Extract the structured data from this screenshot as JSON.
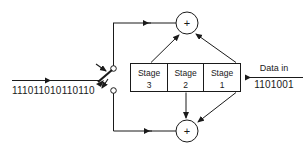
{
  "diagram": {
    "line_color": "#1a1a1a",
    "background": "#ffffff",
    "stages": [
      {
        "name": "Stage",
        "number": "3"
      },
      {
        "name": "Stage",
        "number": "2"
      },
      {
        "name": "Stage",
        "number": "1"
      }
    ],
    "adders": [
      {
        "id": "top-adder",
        "symbol": "+"
      },
      {
        "id": "bottom-adder",
        "symbol": "+"
      }
    ],
    "input": {
      "label": "Data in",
      "bits": "1101001"
    },
    "output": {
      "bits": "111011010110110"
    },
    "switch": {
      "upper_contact": "upper-contact",
      "lower_contact": "lower-contact",
      "state": "upper"
    }
  }
}
